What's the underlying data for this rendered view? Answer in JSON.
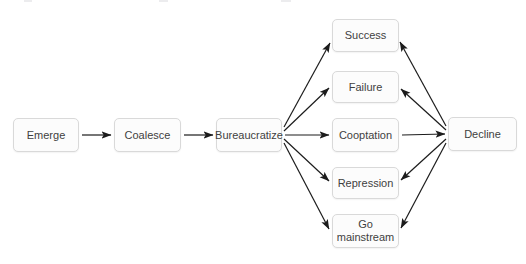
{
  "figure": {
    "type": "flowchart",
    "nodes": [
      {
        "id": "emerge",
        "label": "Emerge"
      },
      {
        "id": "coalesce",
        "label": "Coalesce"
      },
      {
        "id": "bureaucratize",
        "label": "Bureaucratize"
      },
      {
        "id": "success",
        "label": "Success"
      },
      {
        "id": "failure",
        "label": "Failure"
      },
      {
        "id": "cooptation",
        "label": "Cooptation"
      },
      {
        "id": "repression",
        "label": "Repression"
      },
      {
        "id": "go_mainstream",
        "label": "Go mainstream"
      },
      {
        "id": "decline",
        "label": "Decline"
      }
    ],
    "edges": [
      {
        "from": "emerge",
        "to": "coalesce"
      },
      {
        "from": "coalesce",
        "to": "bureaucratize"
      },
      {
        "from": "bureaucratize",
        "to": "success"
      },
      {
        "from": "bureaucratize",
        "to": "failure"
      },
      {
        "from": "bureaucratize",
        "to": "cooptation"
      },
      {
        "from": "bureaucratize",
        "to": "repression"
      },
      {
        "from": "bureaucratize",
        "to": "go_mainstream"
      },
      {
        "from": "cooptation",
        "to": "decline"
      },
      {
        "from": "decline",
        "to": "success"
      },
      {
        "from": "decline",
        "to": "failure"
      },
      {
        "from": "decline",
        "to": "repression"
      },
      {
        "from": "decline",
        "to": "go_mainstream"
      }
    ],
    "colors": {
      "background": "#ffffff",
      "node_fill": "#fcfcfc",
      "node_border": "#d9d9d9",
      "node_text": "#3f3f3f",
      "arrow": "#1c1c1c"
    }
  }
}
